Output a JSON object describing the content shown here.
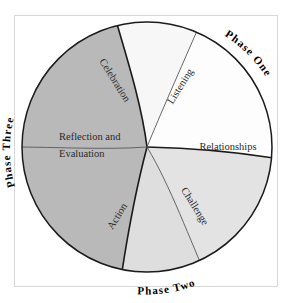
{
  "diagram": {
    "center": {
      "x": 147,
      "y": 147
    },
    "radius": 125,
    "colors": {
      "dark_gray": "#b9b9b9",
      "mid_gray": "#dedede",
      "light_gray": "#e3e3e3",
      "near_white": "#f7f7f7",
      "white": "#fdfdfd",
      "outline": "#1a1a1a",
      "thin_outline": "#555555",
      "frame": "#d8d8d8",
      "text": "#2b2b2b"
    },
    "phases": [
      {
        "id": "phase-one",
        "label": "Phase One",
        "position": "upper-right"
      },
      {
        "id": "phase-two",
        "label": "Phase Two",
        "position": "bottom"
      },
      {
        "id": "phase-three",
        "label": "Phase Three",
        "position": "left"
      }
    ],
    "segments": [
      {
        "id": "listening",
        "label": "Listening",
        "phase": "Phase One",
        "fill": "near_white",
        "rotation": -58
      },
      {
        "id": "relationships",
        "label": "Relationships",
        "phase": "Phase One",
        "fill": "white",
        "rotation": 0
      },
      {
        "id": "challenge",
        "label": "Challenge",
        "phase": "Phase Two",
        "fill": "light_gray",
        "rotation": 58
      },
      {
        "id": "action",
        "label": "Action",
        "phase": "Phase Two",
        "fill": "mid_gray",
        "rotation": -58
      },
      {
        "id": "reflection-and-evaluation",
        "label": "Reflection and Evaluation",
        "line_one": "Reflection and",
        "line_two": "Evaluation",
        "phase": "Phase Three",
        "fill": "dark_gray",
        "rotation": 0
      },
      {
        "id": "celebration",
        "label": "Celebration",
        "phase": "Phase Three",
        "fill": "dark_gray",
        "rotation": 58
      }
    ]
  }
}
